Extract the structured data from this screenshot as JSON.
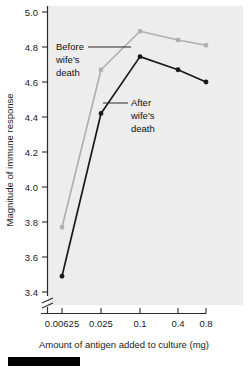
{
  "chart_data": {
    "type": "line",
    "title": "",
    "xlabel": "Amount of antigen added to culture (mg)",
    "ylabel": "Magnitude of immune response",
    "x_scale": "log-categorical",
    "categories": [
      "0.00625",
      "0.025",
      "0.1",
      "0.4",
      "0.8"
    ],
    "xticklabels": [
      "0.00625",
      "0.025",
      "0.1",
      "0.4",
      "0.8"
    ],
    "yticklabels": [
      "3.4",
      "3.6",
      "3.8",
      "4.0",
      "4.2",
      "4.4",
      "4.6",
      "4.8",
      "5.0"
    ],
    "ylim": [
      3.4,
      5.0
    ],
    "ytick_step": 0.2,
    "y_axis_break": true,
    "grid": false,
    "legend": "inline-annotations",
    "series": [
      {
        "name": "Before wife's death",
        "color": "#b0b0b0",
        "marker": "square",
        "values": [
          3.77,
          4.67,
          4.89,
          4.84,
          4.81
        ]
      },
      {
        "name": "After wife's death",
        "color": "#1a1a1a",
        "marker": "circle",
        "values": [
          3.49,
          4.42,
          4.745,
          4.67,
          4.6
        ]
      }
    ],
    "annotations": [
      {
        "text": "Before wife's death",
        "lines": [
          "Before",
          "wife's",
          "death"
        ],
        "target_series": "Before wife's death"
      },
      {
        "text": "After wife's death",
        "lines": [
          "After",
          "wife's",
          "death"
        ],
        "target_series": "After wife's death"
      }
    ],
    "plot_background": "#ededed"
  },
  "axes": {
    "ylabel": "Magnitude of immune response",
    "xlabel": "Amount of antigen added to culture (mg)",
    "yticks": [
      "5.0",
      "4.8",
      "4.6",
      "4.4",
      "4.2",
      "4.0",
      "3.8",
      "3.6",
      "3.4"
    ],
    "xticks": [
      "0.00625",
      "0.025",
      "0.1",
      "0.4",
      "0.8"
    ]
  },
  "annotations": {
    "before": {
      "l1": "Before",
      "l2": "wife's",
      "l3": "death"
    },
    "after": {
      "l1": "After",
      "l2": "wife's",
      "l3": "death"
    }
  }
}
